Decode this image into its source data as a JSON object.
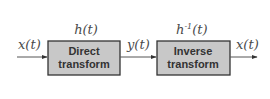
{
  "diagram": {
    "type": "block-diagram",
    "colors": {
      "box_fill": "#c8c8c8",
      "box_stroke": "#333333",
      "line": "#555555",
      "text": "#4a4a4a"
    },
    "blocks": [
      {
        "id": "direct",
        "line1": "Direct",
        "line2": "transform",
        "function": "h(t)"
      },
      {
        "id": "inverse",
        "line1": "Inverse",
        "line2": "transform",
        "function_base": "h",
        "function_sup": "-1",
        "function_arg": "(t)"
      }
    ],
    "signals": {
      "input": "x(t)",
      "intermediate": "y(t)",
      "output": "x(t)"
    },
    "edges": [
      {
        "from": "input",
        "to": "direct"
      },
      {
        "from": "direct",
        "to": "inverse"
      },
      {
        "from": "inverse",
        "to": "output"
      }
    ]
  }
}
